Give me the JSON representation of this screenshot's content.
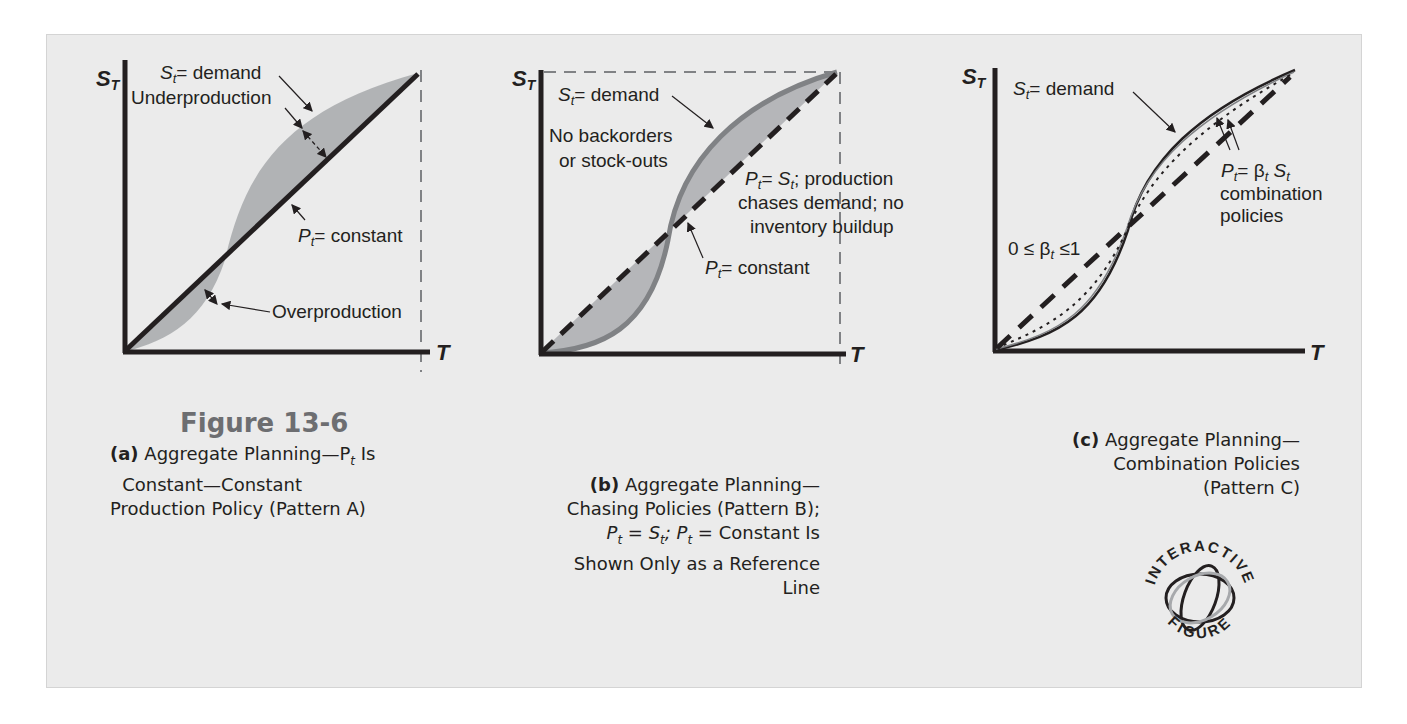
{
  "figure": {
    "title": "Figure 13-6",
    "background_color": "#ebebeb",
    "accent_gray": "#6d6e71"
  },
  "panels": [
    {
      "id": "a",
      "caption_tag": "(a)",
      "caption_lines": [
        "Aggregate Planning—P",
        "t",
        " Is",
        "Constant—Constant",
        "Production Policy (Pattern A)"
      ],
      "y_axis_label": "S",
      "y_axis_sub": "T",
      "x_axis_label": "T",
      "annotations": {
        "demand": "= demand",
        "underproduction": "Underproduction",
        "production": "= constant",
        "overproduction": "Overproduction"
      }
    },
    {
      "id": "b",
      "caption_tag": "(b)",
      "caption_lines": [
        "Aggregate Planning—",
        "Chasing Policies (Pattern B);",
        "P",
        "t",
        " = S",
        "t",
        "; P",
        "t",
        " = Constant Is",
        "Shown Only as a Reference",
        "Line"
      ],
      "y_axis_label": "S",
      "y_axis_sub": "T",
      "x_axis_label": "T",
      "annotations": {
        "demand": "= demand",
        "no_backorders_1": "No backorders",
        "no_backorders_2": "or stock-outs",
        "chase_1": "= S",
        "chase_1_tail": "; production",
        "chase_2": "chases demand; no",
        "chase_3": "inventory buildup",
        "production": "= constant"
      }
    },
    {
      "id": "c",
      "caption_tag": "(c)",
      "caption_lines": [
        "Aggregate Planning—",
        "Combination Policies",
        "(Pattern C)"
      ],
      "y_axis_label": "S",
      "y_axis_sub": "T",
      "x_axis_label": "T",
      "annotations": {
        "demand": "= demand",
        "combo_1": "= β",
        "combo_2": "combination",
        "combo_3": "policies",
        "beta_range": "0 ≤ β",
        "beta_range_tail": " ≤1"
      }
    }
  ],
  "logo": {
    "top_text": "INTERACTIVE",
    "bottom_text": "FIGURE"
  }
}
